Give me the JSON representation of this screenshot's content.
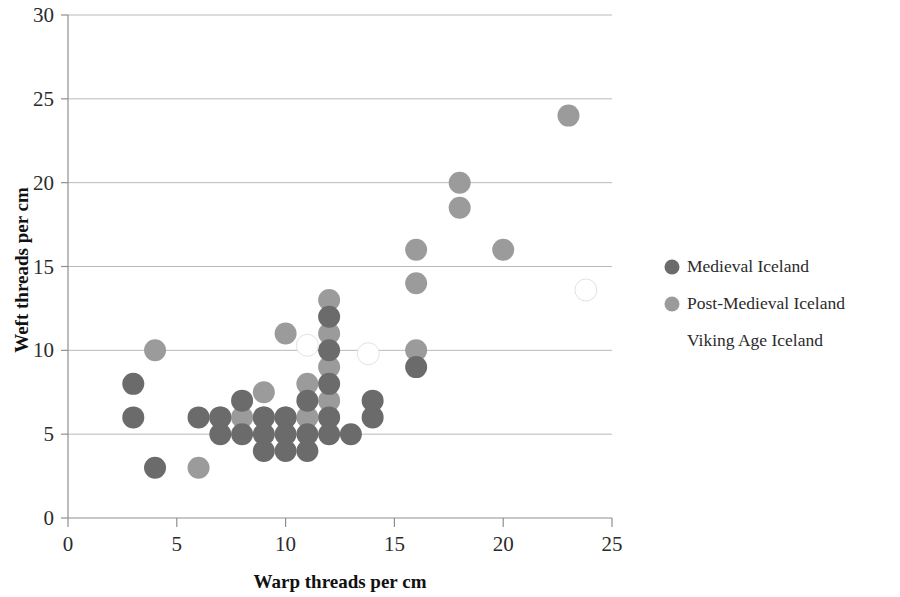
{
  "chart_data": {
    "type": "scatter",
    "title": "",
    "xlabel": "Warp threads per cm",
    "ylabel": "Weft threads per cm",
    "xlim": [
      0,
      25
    ],
    "ylim": [
      0,
      30
    ],
    "xticks": [
      0,
      5,
      10,
      15,
      20,
      25
    ],
    "yticks": [
      0,
      5,
      10,
      15,
      20,
      25,
      30
    ],
    "grid": "horizontal",
    "legend_position": "right",
    "series": [
      {
        "name": "Medieval Iceland",
        "color": "#6b6b6b",
        "points": [
          [
            3,
            8
          ],
          [
            3,
            6
          ],
          [
            4,
            3
          ],
          [
            6,
            6
          ],
          [
            7,
            6
          ],
          [
            7,
            5
          ],
          [
            8,
            7
          ],
          [
            8,
            5
          ],
          [
            9,
            6
          ],
          [
            9,
            5
          ],
          [
            9,
            4
          ],
          [
            10,
            6
          ],
          [
            10,
            5
          ],
          [
            10,
            4
          ],
          [
            11,
            7
          ],
          [
            11,
            5
          ],
          [
            11,
            4
          ],
          [
            12,
            12
          ],
          [
            12,
            10
          ],
          [
            12,
            8
          ],
          [
            12,
            6
          ],
          [
            12,
            5
          ],
          [
            13,
            5
          ],
          [
            14,
            7
          ],
          [
            14,
            6
          ],
          [
            16,
            9
          ]
        ]
      },
      {
        "name": "Post-Medieval Iceland",
        "color": "#9b9b9b",
        "points": [
          [
            4,
            10
          ],
          [
            6,
            3
          ],
          [
            7,
            6
          ],
          [
            8,
            6
          ],
          [
            9,
            7.5
          ],
          [
            9,
            6
          ],
          [
            10,
            11
          ],
          [
            10,
            6
          ],
          [
            11,
            8
          ],
          [
            11,
            6
          ],
          [
            12,
            13
          ],
          [
            12,
            11
          ],
          [
            12,
            9
          ],
          [
            12,
            7
          ],
          [
            16,
            16
          ],
          [
            16,
            14
          ],
          [
            16,
            10
          ],
          [
            18,
            20
          ],
          [
            18,
            18.5
          ],
          [
            20,
            16
          ],
          [
            23,
            24
          ]
        ]
      },
      {
        "name": "Viking Age Iceland",
        "color": "#ffffff",
        "points": [
          [
            11,
            10.3
          ],
          [
            13.8,
            9.8
          ],
          [
            23.8,
            13.6
          ]
        ]
      }
    ]
  },
  "legend": {
    "items": [
      {
        "label": "Medieval Iceland",
        "marker_color": "#6b6b6b"
      },
      {
        "label": "Post-Medieval Iceland",
        "marker_color": "#9b9b9b"
      },
      {
        "label": "Viking Age Iceland",
        "marker_color": "#ffffff"
      }
    ]
  },
  "axes": {
    "x_title": "Warp threads per cm",
    "y_title": "Weft threads per cm",
    "x_tick_labels": [
      "0",
      "5",
      "10",
      "15",
      "20",
      "25"
    ],
    "y_tick_labels": [
      "0",
      "5",
      "10",
      "15",
      "20",
      "25",
      "30"
    ]
  }
}
